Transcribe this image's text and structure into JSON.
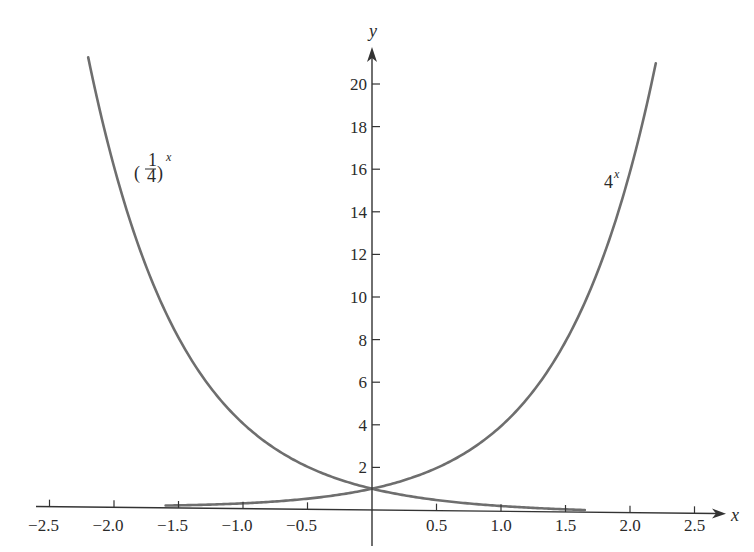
{
  "chart_data": {
    "type": "line",
    "title": "",
    "xlabel": "x",
    "ylabel": "y",
    "xlim": [
      -2.5,
      2.5
    ],
    "ylim": [
      0,
      21
    ],
    "grid": false,
    "legend": null,
    "x_ticks": [
      -2.5,
      -2.0,
      -1.5,
      -1.0,
      -0.5,
      0.5,
      1.0,
      1.5,
      2.0,
      2.5
    ],
    "x_tick_labels": [
      "−2.5",
      "−2.0",
      "−1.5",
      "−1.0",
      "−0.5",
      "0.5",
      "1.0",
      "1.5",
      "2.0",
      "2.5"
    ],
    "y_ticks": [
      2,
      4,
      6,
      8,
      10,
      12,
      14,
      16,
      18,
      20
    ],
    "y_tick_labels": [
      "2",
      "4",
      "6",
      "8",
      "10",
      "12",
      "14",
      "16",
      "18",
      "20"
    ],
    "series": [
      {
        "name": "(1/4)^x",
        "label_main": "1",
        "label_den": "4",
        "label_exp": "x",
        "x_range": [
          -2.2,
          1.65
        ],
        "x": [
          -2.2,
          -2.0,
          -1.5,
          -1.0,
          -0.5,
          0,
          0.5,
          1.0,
          1.5,
          1.65
        ],
        "values": [
          21.1,
          16,
          8,
          4,
          2,
          1,
          0.5,
          0.25,
          0.125,
          0.1
        ]
      },
      {
        "name": "4^x",
        "label_main": "4",
        "label_exp": "x",
        "x_range": [
          -1.6,
          2.2
        ],
        "x": [
          -1.6,
          -1.5,
          -1.0,
          -0.5,
          0,
          0.5,
          1.0,
          1.5,
          2.0,
          2.2
        ],
        "values": [
          0.11,
          0.125,
          0.25,
          0.5,
          1,
          2,
          4,
          8,
          16,
          21.1
        ]
      }
    ],
    "annotations": [
      {
        "text": "(1/4)^x",
        "near_x": -1.7,
        "near_y": 15.5
      },
      {
        "text": "4^x",
        "near_x": 1.85,
        "near_y": 15.5
      }
    ]
  },
  "labels": {
    "x_axis": "x",
    "y_axis": "y",
    "curve1_num": "1",
    "curve1_den": "4",
    "curve1_exp": "x",
    "curve2_base": "4",
    "curve2_exp": "x"
  },
  "colors": {
    "axis": "#333333",
    "curve": "#6e6e6e",
    "text": "#2a2a2a"
  }
}
